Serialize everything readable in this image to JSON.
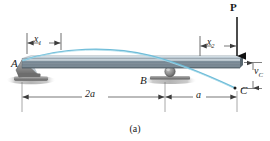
{
  "figure": {
    "caption": "(a)",
    "type": "beam-deflection-diagram"
  },
  "labels": {
    "support_a": "A",
    "support_b": "B",
    "point_c": "C",
    "load_p": "P",
    "dim_x1_base": "x",
    "dim_x1_sub": "1",
    "dim_x2_base": "x",
    "dim_x2_sub": "2",
    "dim_span_ab": "2a",
    "dim_span_bc": "a",
    "deflection_base": "v",
    "deflection_sub": "C"
  },
  "colors": {
    "beam_top": "#b9c6cf",
    "beam_body": "#7d8e99",
    "beam_dark": "#5d6b75",
    "beam_light": "#d7e0e6",
    "curve": "#6fbcd8",
    "support": "#8a8a8a",
    "support_dark": "#5a5a5a",
    "ink": "#1a1a1a",
    "dim_line": "#4a4a4a",
    "ground": "#9a9a9a"
  },
  "geometry": {
    "beam_left_x": 22,
    "beam_right_x": 240,
    "beam_top_y": 58,
    "beam_bottom_y": 68,
    "support_a_x": 22,
    "support_b_x": 165,
    "point_c_x": 237,
    "load_p_x": 237,
    "dim_line_y": 97,
    "x1_dim_y": 43,
    "x2_dim_y": 46,
    "deflection_c_y": 88
  },
  "elements": {
    "support_a_type": "pin",
    "support_b_type": "roller",
    "load_direction": "downward",
    "curve_description": "elastic-deflection-curve"
  }
}
